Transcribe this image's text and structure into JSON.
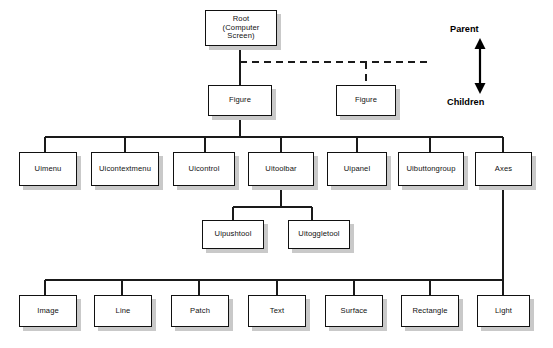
{
  "diagram": {
    "background_color": "#ffffff",
    "box_fill_color": "#ffffff",
    "box_border_color": "#111111",
    "shadow_color": "#c9c9c9",
    "line_color": "#1a1a1a"
  },
  "legend": {
    "parent_label": "Parent",
    "children_label": "Children",
    "arrow_icon": "double-headed-vertical-arrow-icon"
  },
  "nodes": {
    "root": {
      "label": "Root\n(Computer Screen)",
      "level": 1
    },
    "figure_1": {
      "label": "Figure",
      "level": 2
    },
    "figure_2": {
      "label": "Figure",
      "level": 2
    },
    "uimenu": {
      "label": "Uimenu",
      "level": 3
    },
    "uicontextmenu": {
      "label": "Uicontextmenu",
      "level": 3
    },
    "uicontrol": {
      "label": "Uicontrol",
      "level": 3
    },
    "uitoolbar": {
      "label": "Uitoolbar",
      "level": 3
    },
    "uipanel": {
      "label": "Uipanel",
      "level": 3
    },
    "uibuttongroup": {
      "label": "Uibuttongroup",
      "level": 3
    },
    "axes": {
      "label": "Axes",
      "level": 3
    },
    "uipushtool": {
      "label": "Uipushtool",
      "level": 4
    },
    "uitoggletool": {
      "label": "Uitoggletool",
      "level": 4
    },
    "image": {
      "label": "Image",
      "level": 5
    },
    "line": {
      "label": "Line",
      "level": 5
    },
    "patch": {
      "label": "Patch",
      "level": 5
    },
    "text": {
      "label": "Text",
      "level": 5
    },
    "surface": {
      "label": "Surface",
      "level": 5
    },
    "rectangle": {
      "label": "Rectangle",
      "level": 5
    },
    "light": {
      "label": "Light",
      "level": 5
    }
  },
  "edges": [
    {
      "from": "root",
      "to": "figure_1",
      "style": "solid"
    },
    {
      "from": "root",
      "to": "figure_2",
      "style": "dashed"
    },
    {
      "from": "figure_1",
      "to": "uimenu",
      "style": "solid"
    },
    {
      "from": "figure_1",
      "to": "uicontextmenu",
      "style": "solid"
    },
    {
      "from": "figure_1",
      "to": "uicontrol",
      "style": "solid"
    },
    {
      "from": "figure_1",
      "to": "uitoolbar",
      "style": "solid"
    },
    {
      "from": "figure_1",
      "to": "uipanel",
      "style": "solid"
    },
    {
      "from": "figure_1",
      "to": "uibuttongroup",
      "style": "solid"
    },
    {
      "from": "figure_1",
      "to": "axes",
      "style": "solid"
    },
    {
      "from": "uitoolbar",
      "to": "uipushtool",
      "style": "solid"
    },
    {
      "from": "uitoolbar",
      "to": "uitoggletool",
      "style": "solid"
    },
    {
      "from": "axes",
      "to": "image",
      "style": "solid"
    },
    {
      "from": "axes",
      "to": "line",
      "style": "solid"
    },
    {
      "from": "axes",
      "to": "patch",
      "style": "solid"
    },
    {
      "from": "axes",
      "to": "text",
      "style": "solid"
    },
    {
      "from": "axes",
      "to": "surface",
      "style": "solid"
    },
    {
      "from": "axes",
      "to": "rectangle",
      "style": "solid"
    },
    {
      "from": "axes",
      "to": "light",
      "style": "solid"
    }
  ]
}
